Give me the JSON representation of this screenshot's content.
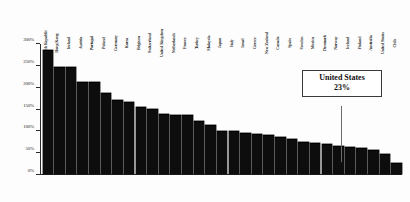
{
  "callout": {
    "title": "United States",
    "value": "23%"
  },
  "chart_data": {
    "type": "bar",
    "title": "",
    "subtitle": "",
    "xlabel": "",
    "ylabel": "",
    "ylim": [
      0,
      300
    ],
    "ytick_labels": [
      "0%",
      "50%",
      "100%",
      "150%",
      "200%",
      "250%",
      "300%"
    ],
    "ytick_values": [
      0,
      50,
      100,
      150,
      200,
      250,
      300
    ],
    "grid": false,
    "legend": null,
    "bar_color": "#0d0d0d",
    "value_unit": "%",
    "categories": [
      "Czech Republic",
      "Hong Kong",
      "Ireland",
      "Austria",
      "Portugal",
      "Poland",
      "Germany",
      "Korea",
      "Belgium",
      "Switzerland",
      "United Kingdom",
      "Netherlands",
      "France",
      "Turkey",
      "Malaysia",
      "Japan",
      "Italy",
      "Israel",
      "Greece",
      "New Zealand",
      "Canada",
      "Spain",
      "Sweden",
      "Mexico",
      "Denmark",
      "Norway",
      "Iceland",
      "Finland",
      "Australia",
      "United States",
      "Chile"
    ],
    "values": [
      285,
      245,
      245,
      210,
      210,
      185,
      168,
      165,
      152,
      148,
      137,
      135,
      135,
      120,
      110,
      98,
      97,
      93,
      90,
      88,
      82,
      78,
      72,
      70,
      66,
      62,
      60,
      57,
      52,
      45,
      23
    ]
  }
}
